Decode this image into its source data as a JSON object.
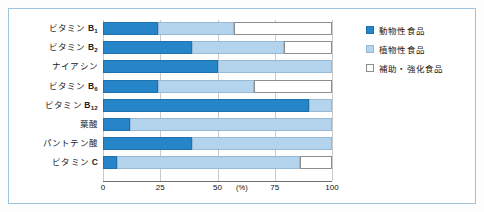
{
  "chart_data": {
    "type": "bar",
    "orientation": "horizontal",
    "stacked": true,
    "title": "",
    "xlabel": "(%)",
    "ylabel": "",
    "xlim": [
      0,
      100
    ],
    "xticks": [
      0,
      25,
      50,
      75,
      100
    ],
    "xtick_labels": [
      "0",
      "25",
      "50",
      "75",
      "100"
    ],
    "unit_label": "(%)",
    "grid": "vertical",
    "legend_position": "right",
    "categories": [
      "ビタミンB1",
      "ビタミンB2",
      "ナイアシン",
      "ビタミンB6",
      "ビタミンB12",
      "葉酸",
      "パントテン酸",
      "ビタミンC"
    ],
    "series": [
      {
        "name": "動物性食品",
        "color": "#2585c8",
        "values": [
          24,
          39,
          50,
          24,
          90,
          12,
          39,
          6
        ]
      },
      {
        "name": "植物性食品",
        "color": "#b4d3ec",
        "values": [
          33,
          40,
          50,
          42,
          10,
          88,
          61,
          80
        ]
      },
      {
        "name": "補助・強化食品",
        "color": "#ffffff",
        "values": [
          43,
          21,
          0,
          34,
          0,
          0,
          0,
          14
        ]
      }
    ]
  },
  "labels": {
    "rows": [
      {
        "prefix": "ビタミン",
        "suffix": "B",
        "sub": "1"
      },
      {
        "prefix": "ビタミン",
        "suffix": "B",
        "sub": "2"
      },
      {
        "prefix": "ナイアシン",
        "suffix": "",
        "sub": ""
      },
      {
        "prefix": "ビタミン",
        "suffix": "B",
        "sub": "6"
      },
      {
        "prefix": "ビタミン",
        "suffix": "B",
        "sub": "12"
      },
      {
        "prefix": "葉酸",
        "suffix": "",
        "sub": ""
      },
      {
        "prefix": "パントテン酸",
        "suffix": "",
        "sub": ""
      },
      {
        "prefix": "ビタミン",
        "suffix": "C",
        "sub": ""
      }
    ]
  },
  "legend": {
    "items": [
      {
        "label": "動物性食品",
        "swatch": "animal"
      },
      {
        "label": "植物性食品",
        "swatch": "plant"
      },
      {
        "label": "補助・強化食品",
        "swatch": "fortify"
      }
    ]
  }
}
